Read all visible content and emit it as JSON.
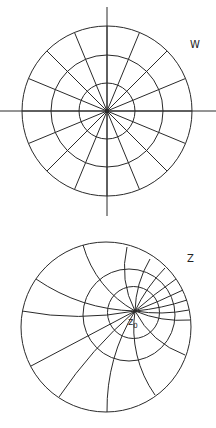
{
  "colors": {
    "line": "#2a2a2a",
    "background": "#ffffff"
  },
  "w_plane": {
    "label": "W",
    "label_pos": [
      190,
      40
    ],
    "center": [
      107,
      111
    ],
    "circle_radii": [
      28,
      56,
      85
    ],
    "ray_count": 16,
    "axis": {
      "h": [
        0,
        216
      ],
      "v": [
        7,
        216
      ]
    }
  },
  "z_plane": {
    "label": "Z",
    "label_pos": [
      187,
      254
    ],
    "center": [
      106,
      327
    ],
    "radius": 85,
    "point_label": "z",
    "point_subscript": "0",
    "point": [
      135,
      311
    ],
    "point_label_pos": [
      128,
      317
    ],
    "apollonius_circles": [
      {
        "cx": 133.5,
        "cy": 312.5,
        "r": 26
      },
      {
        "cx": 129,
        "cy": 315,
        "r": 46
      }
    ],
    "arc_endpoints": [
      [
        83,
        245
      ],
      [
        127,
        247
      ],
      [
        150,
        259
      ],
      [
        165,
        268
      ],
      [
        176,
        279
      ],
      [
        183,
        290
      ],
      [
        187,
        300
      ],
      [
        189,
        310
      ],
      [
        190,
        320
      ],
      [
        185,
        355
      ],
      [
        155,
        395
      ],
      [
        107,
        412
      ],
      [
        59,
        397
      ],
      [
        31,
        366
      ],
      [
        22,
        311
      ],
      [
        36,
        279
      ]
    ]
  }
}
